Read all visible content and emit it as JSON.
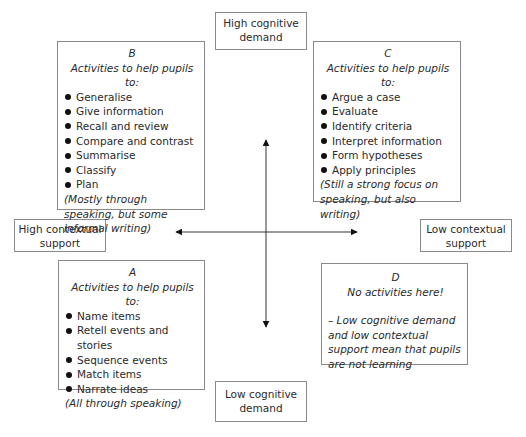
{
  "axes": {
    "top": "High cognitive demand",
    "bottom": "Low cognitive demand",
    "left": "High contextual support",
    "right": "Low contextual support"
  },
  "quadrants": {
    "B": {
      "letter": "B",
      "heading": "Activities to help pupils to:",
      "items": [
        "Generalise",
        "Give information",
        "Recall and review",
        "Compare and contrast",
        "Summarise",
        "Classify",
        "Plan"
      ],
      "note": "(Mostly through speaking, but some informal writing)"
    },
    "C": {
      "letter": "C",
      "heading": "Activities to help pupils to:",
      "items": [
        "Argue a case",
        "Evaluate",
        "Identify criteria",
        "Interpret information",
        "Form hypotheses",
        "Apply principles"
      ],
      "note": "(Still a strong focus on speaking, but also writing)"
    },
    "A": {
      "letter": "A",
      "heading": "Activities to help pupils to:",
      "items": [
        "Name items",
        "Retell events and stories",
        "Sequence events",
        "Match items",
        "Narrate ideas"
      ],
      "note": "(All through speaking)"
    },
    "D": {
      "letter": "D",
      "heading": "No activities here!",
      "note": "– Low cognitive demand and low contextual support mean that pupils are not learning"
    }
  },
  "colors": {
    "border": "#8a8a8a",
    "arrow": "#111111",
    "text": "#2a2a2a"
  }
}
